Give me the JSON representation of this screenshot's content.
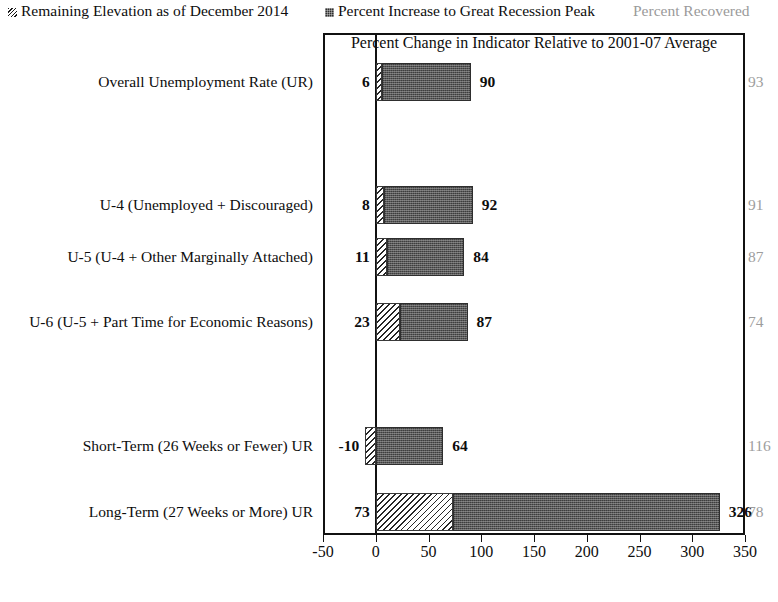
{
  "legend": {
    "hatched_label": "Remaining Elevation as of December 2014",
    "hatched_swatch_name": "hatched-swatch",
    "solid_label": "Percent Increase to Great Recession Peak",
    "solid_swatch_name": "dotted-swatch",
    "recovered_label": "Percent Recovered",
    "recovered_color": "#9a9a9a"
  },
  "chart_data": {
    "type": "bar",
    "orientation": "horizontal",
    "stacked": true,
    "title": "",
    "xlabel": "Percent Change in Indicator Relative to 2001-07 Average",
    "ylabel": "",
    "xlim": [
      -50,
      350
    ],
    "xticks": [
      -50,
      0,
      50,
      100,
      150,
      200,
      250,
      300,
      350
    ],
    "xtick_labels": [
      "-50",
      "0",
      "50",
      "100",
      "150",
      "200",
      "250",
      "300",
      "350"
    ],
    "grid": false,
    "legend_position": "top",
    "categories": [
      "Overall Unemployment Rate (UR)",
      "",
      "U-4 (Unemployed + Discouraged)",
      "U-5 (U-4 + Other Marginally Attached)",
      "U-6 (U-5 + Part Time for Economic Reasons)",
      "",
      "Short-Term (26 Weeks or Fewer) UR",
      "Long-Term (27 Weeks or More) UR"
    ],
    "series": [
      {
        "name": "Remaining Elevation as of December 2014",
        "pattern": "diagonal-hatch",
        "values": [
          6,
          null,
          8,
          11,
          23,
          null,
          -10,
          73
        ]
      },
      {
        "name": "Percent Increase to Great Recession Peak",
        "pattern": "dotted-fill",
        "values": [
          90,
          null,
          92,
          84,
          87,
          null,
          64,
          326
        ]
      }
    ],
    "percent_recovered": [
      93,
      null,
      91,
      87,
      74,
      null,
      116,
      78
    ],
    "rows": [
      {
        "category": "Overall Unemployment Rate (UR)",
        "remaining_elevation": 6,
        "remaining_elevation_label": "6",
        "peak_increase": 90,
        "peak_increase_label": "90",
        "percent_recovered": 93,
        "percent_recovered_label": "93"
      },
      {
        "category": "U-4 (Unemployed + Discouraged)",
        "remaining_elevation": 8,
        "remaining_elevation_label": "8",
        "peak_increase": 92,
        "peak_increase_label": "92",
        "percent_recovered": 91,
        "percent_recovered_label": "91"
      },
      {
        "category": "U-5 (U-4 + Other Marginally Attached)",
        "remaining_elevation": 11,
        "remaining_elevation_label": "11",
        "peak_increase": 84,
        "peak_increase_label": "84",
        "percent_recovered": 87,
        "percent_recovered_label": "87"
      },
      {
        "category": "U-6 (U-5 + Part Time for Economic Reasons)",
        "remaining_elevation": 23,
        "remaining_elevation_label": "23",
        "peak_increase": 87,
        "peak_increase_label": "87",
        "percent_recovered": 74,
        "percent_recovered_label": "74"
      },
      {
        "category": "Short-Term (26 Weeks or Fewer) UR",
        "remaining_elevation": -10,
        "remaining_elevation_label": "-10",
        "peak_increase": 64,
        "peak_increase_label": "64",
        "percent_recovered": 116,
        "percent_recovered_label": "116"
      },
      {
        "category": "Long-Term (27 Weeks or More) UR",
        "remaining_elevation": 73,
        "remaining_elevation_label": "73",
        "peak_increase": 326,
        "peak_increase_label": "326",
        "percent_recovered": 78,
        "percent_recovered_label": "78"
      }
    ]
  }
}
